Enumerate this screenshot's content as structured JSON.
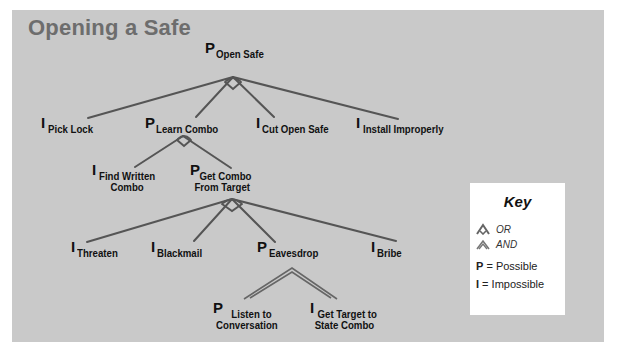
{
  "title": "Opening a Safe",
  "colors": {
    "panel": "#c9c9c9",
    "title": "#6d6d6d",
    "edge": "#555555",
    "text": "#111111",
    "key_bg": "#ffffff"
  },
  "nodes": {
    "root": {
      "mark": "P",
      "label": "Open Safe"
    },
    "pick_lock": {
      "mark": "I",
      "label": "Pick Lock"
    },
    "learn_combo": {
      "mark": "P",
      "label": "Learn Combo"
    },
    "cut_open_safe": {
      "mark": "I",
      "label": "Cut Open Safe"
    },
    "install_improperly": {
      "mark": "I",
      "label": "Install Improperly"
    },
    "find_written_combo": {
      "mark": "I",
      "label_line1": "Find Written",
      "label_line2": "Combo"
    },
    "get_combo_from_target": {
      "mark": "P",
      "label_line1": "Get Combo",
      "label_line2": "From Target"
    },
    "threaten": {
      "mark": "I",
      "label": "Threaten"
    },
    "blackmail": {
      "mark": "I",
      "label": "Blackmail"
    },
    "eavesdrop": {
      "mark": "P",
      "label": "Eavesdrop"
    },
    "bribe": {
      "mark": "I",
      "label": "Bribe"
    },
    "listen_to_conversation": {
      "mark": "P",
      "label_line1": "Listen to",
      "label_line2": "Conversation"
    },
    "get_target_to_state_combo": {
      "mark": "I",
      "label_line1": "Get Target to",
      "label_line2": "State Combo"
    }
  },
  "edges": [
    {
      "from": "root",
      "to": "pick_lock",
      "gate": "OR"
    },
    {
      "from": "root",
      "to": "learn_combo",
      "gate": "OR"
    },
    {
      "from": "root",
      "to": "cut_open_safe",
      "gate": "OR"
    },
    {
      "from": "root",
      "to": "install_improperly",
      "gate": "OR"
    },
    {
      "from": "learn_combo",
      "to": "find_written_combo",
      "gate": "OR"
    },
    {
      "from": "learn_combo",
      "to": "get_combo_from_target",
      "gate": "OR"
    },
    {
      "from": "get_combo_from_target",
      "to": "threaten",
      "gate": "OR"
    },
    {
      "from": "get_combo_from_target",
      "to": "blackmail",
      "gate": "OR"
    },
    {
      "from": "get_combo_from_target",
      "to": "eavesdrop",
      "gate": "OR"
    },
    {
      "from": "get_combo_from_target",
      "to": "bribe",
      "gate": "OR"
    },
    {
      "from": "eavesdrop",
      "to": "listen_to_conversation",
      "gate": "AND"
    },
    {
      "from": "eavesdrop",
      "to": "get_target_to_state_combo",
      "gate": "AND"
    }
  ],
  "key": {
    "title": "Key",
    "or_label": "OR",
    "and_label": "AND",
    "possible_mark": "P",
    "possible_text": " = Possible",
    "impossible_mark": "I",
    "impossible_text": " = Impossible"
  }
}
